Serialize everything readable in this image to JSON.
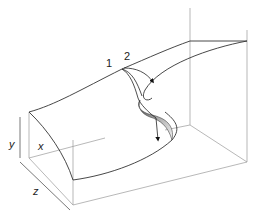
{
  "figure": {
    "axes": {
      "x_label": "x",
      "y_label": "y",
      "z_label": "z"
    },
    "path_labels": {
      "path1": "1",
      "path2": "2"
    },
    "colors": {
      "line": "#333333",
      "box": "#999999",
      "fold_shade_dark": "#555555",
      "fold_shade_light": "#eeeeee",
      "background": "#ffffff"
    }
  }
}
